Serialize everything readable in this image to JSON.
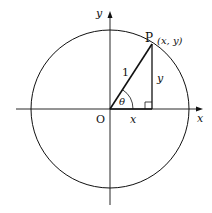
{
  "diagram": {
    "type": "unit-circle",
    "labels": {
      "y_axis": "y",
      "x_axis": "x",
      "origin": "O",
      "point": "P",
      "point_coords": "(x, y)",
      "hypotenuse": "1",
      "opposite": "y",
      "adjacent": "x",
      "angle": "θ"
    },
    "colors": {
      "stroke": "#111111",
      "background": "#ffffff"
    }
  }
}
